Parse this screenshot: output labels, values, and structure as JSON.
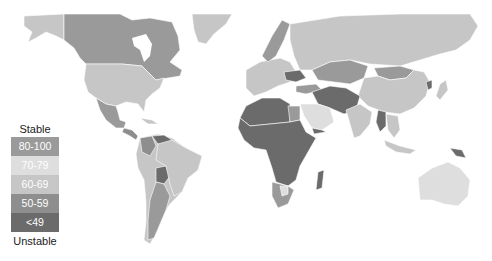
{
  "legend": {
    "top_label": "Stable",
    "bottom_label": "Unstable",
    "classes": [
      {
        "label": "80-100",
        "color": "#9a9a9a"
      },
      {
        "label": "70-79",
        "color": "#dedede"
      },
      {
        "label": "60-69",
        "color": "#c6c6c6"
      },
      {
        "label": "50-59",
        "color": "#8e8e8e"
      },
      {
        "label": "<49",
        "color": "#6b6b6b"
      }
    ]
  },
  "map": {
    "colors": {
      "c80": "#9a9a9a",
      "c70": "#dedede",
      "c60": "#c6c6c6",
      "c50": "#8e8e8e",
      "c49": "#6b6b6b",
      "border": "#ffffff"
    }
  }
}
